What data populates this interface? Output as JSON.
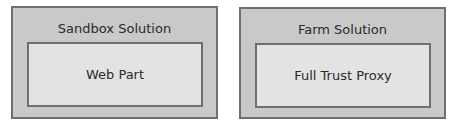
{
  "diagram": {
    "boxes": [
      {
        "title": "Sandbox Solution",
        "inner": {
          "label": "Web Part"
        }
      },
      {
        "title": "Farm Solution",
        "inner": {
          "label": "Full Trust Proxy"
        }
      }
    ],
    "colors": {
      "outer_fill": "#c9c9c9",
      "inner_fill": "#e3e3e3",
      "border": "#6f6f6f",
      "text": "#2a2a2a"
    }
  }
}
